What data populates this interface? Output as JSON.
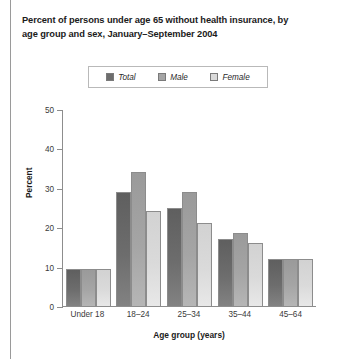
{
  "chart_data": {
    "type": "bar",
    "title": "Percent of persons under age 65 without health insurance, by age group and sex, January–September 2004",
    "title_lines": [
      "Percent of persons under age 65 without health insurance, by",
      "age group and sex, January–September 2004"
    ],
    "xlabel": "Age group (years)",
    "ylabel": "Percent",
    "categories": [
      "Under 18",
      "18–24",
      "25–34",
      "35–44",
      "45–64"
    ],
    "series": [
      {
        "name": "Total",
        "color": "#6d6d6d",
        "values": [
          9.3,
          29,
          25,
          17,
          12
        ]
      },
      {
        "name": "Male",
        "color": "#a5a5a5",
        "values": [
          9.3,
          34,
          29,
          18.5,
          12
        ]
      },
      {
        "name": "Female",
        "color": "#dadada",
        "values": [
          9.3,
          24,
          21,
          16,
          12
        ]
      }
    ],
    "ylim": [
      0,
      50
    ],
    "yticks": [
      0,
      10,
      20,
      30,
      40,
      50
    ],
    "ytick_labels": [
      "0",
      "10",
      "20",
      "30",
      "40",
      "50"
    ],
    "grid": false,
    "legend_position": "top-center"
  }
}
